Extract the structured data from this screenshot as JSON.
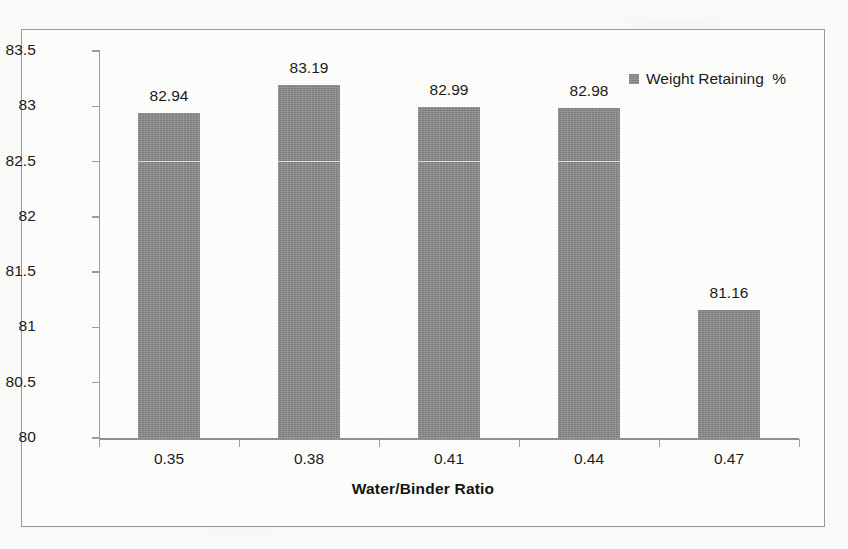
{
  "chart_data": {
    "type": "bar",
    "title": "",
    "xlabel": "Water/Binder Ratio",
    "ylabel": "",
    "categories": [
      "0.35",
      "0.38",
      "0.41",
      "0.44",
      "0.47"
    ],
    "values": [
      82.94,
      83.19,
      82.99,
      82.98,
      81.16
    ],
    "value_labels": [
      "82.94",
      "83.19",
      "82.99",
      "82.98",
      "81.16"
    ],
    "series": [
      {
        "name": "Weight Retaining  %",
        "values": [
          82.94,
          83.19,
          82.99,
          82.98,
          81.16
        ],
        "color": "#8a8a8a"
      }
    ],
    "ylim": [
      80,
      83.5
    ],
    "ytick_labels": [
      "83.5",
      "83",
      "82.5",
      "82",
      "81.5",
      "81",
      "80.5",
      "80"
    ],
    "ytick_values": [
      83.5,
      83,
      82.5,
      82,
      81.5,
      81,
      80.5,
      80
    ],
    "ytick_step": 0.5,
    "grid": false,
    "legend": {
      "entries": [
        "Weight Retaining  %"
      ],
      "position": "top-right",
      "marker": "square"
    },
    "axis_color": "#9a9a9a",
    "text_color": "#1b1b1b"
  },
  "legend": {
    "label": "Weight Retaining  %"
  },
  "axis": {
    "x_title": "Water/Binder Ratio"
  }
}
